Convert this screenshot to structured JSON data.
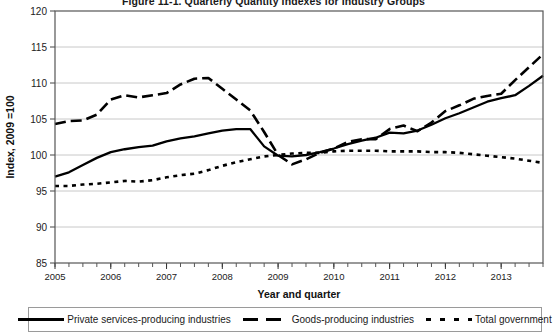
{
  "chart_data": {
    "type": "line",
    "title": "Figure 11-1. Quarterly Quantity Indexes for Industry Groups",
    "xlabel": "Year and quarter",
    "ylabel": "Index, 2009 =100",
    "ylim": [
      85,
      120
    ],
    "yticks": [
      85,
      90,
      95,
      100,
      105,
      110,
      115,
      120
    ],
    "xlim": [
      2005.0,
      2013.75
    ],
    "xticks": [
      2005,
      2006,
      2007,
      2008,
      2009,
      2010,
      2011,
      2012,
      2013
    ],
    "xtick_labels": [
      "2005",
      "2006",
      "2007",
      "2008",
      "2009",
      "2010",
      "2011",
      "2012",
      "2013"
    ],
    "minor_x_interval": 0.25,
    "grid": "horizontal",
    "legend_position": "bottom",
    "x": [
      2005.0,
      2005.25,
      2005.5,
      2005.75,
      2006.0,
      2006.25,
      2006.5,
      2006.75,
      2007.0,
      2007.25,
      2007.5,
      2007.75,
      2008.0,
      2008.25,
      2008.5,
      2008.75,
      2009.0,
      2009.25,
      2009.5,
      2009.75,
      2010.0,
      2010.25,
      2010.5,
      2010.75,
      2011.0,
      2011.25,
      2011.5,
      2011.75,
      2012.0,
      2012.25,
      2012.5,
      2012.75,
      2013.0,
      2013.25,
      2013.5,
      2013.75
    ],
    "series": [
      {
        "name": "Private services-producing industries",
        "style": "solid",
        "color": "#000000",
        "values": [
          97.0,
          97.6,
          98.6,
          99.6,
          100.4,
          100.8,
          101.1,
          101.3,
          101.9,
          102.3,
          102.6,
          103.0,
          103.4,
          103.6,
          103.6,
          101.2,
          99.9,
          99.8,
          100.0,
          100.4,
          100.9,
          101.5,
          102.0,
          102.4,
          103.1,
          103.0,
          103.4,
          104.2,
          105.1,
          105.8,
          106.6,
          107.4,
          107.9,
          108.3,
          109.6,
          111.0
        ]
      },
      {
        "name": "Goods-producing industries",
        "style": "dashed",
        "color": "#000000",
        "values": [
          104.3,
          104.7,
          104.8,
          105.6,
          107.7,
          108.3,
          108.0,
          108.3,
          108.6,
          109.8,
          110.6,
          110.7,
          109.2,
          107.7,
          106.2,
          103.2,
          100.0,
          98.7,
          99.4,
          100.3,
          100.9,
          101.8,
          102.2,
          102.2,
          103.6,
          104.1,
          103.3,
          104.5,
          106.1,
          106.9,
          107.8,
          108.2,
          108.5,
          110.4,
          112.2,
          114.0
        ]
      },
      {
        "name": "Total government",
        "style": "dotted",
        "color": "#000000",
        "values": [
          95.7,
          95.7,
          95.9,
          96.0,
          96.2,
          96.4,
          96.3,
          96.5,
          96.9,
          97.2,
          97.4,
          97.9,
          98.5,
          99.0,
          99.4,
          99.8,
          100.0,
          100.2,
          100.3,
          100.3,
          100.5,
          100.6,
          100.6,
          100.6,
          100.5,
          100.5,
          100.5,
          100.4,
          100.4,
          100.3,
          100.1,
          99.9,
          99.7,
          99.5,
          99.2,
          98.9
        ]
      }
    ]
  },
  "legend": {
    "entries": [
      {
        "label": "Private services-producing industries",
        "style": "solid"
      },
      {
        "label": "Goods-producing industries",
        "style": "dashed"
      },
      {
        "label": "Total government",
        "style": "dotted"
      }
    ]
  }
}
